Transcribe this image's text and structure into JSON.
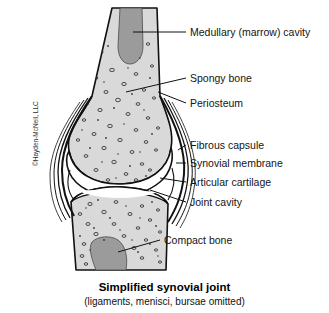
{
  "figure": {
    "title": "Simplified synovial joint",
    "subtitle": "(ligaments, menisci, bursae omitted)",
    "credit": "©Hayden-McNeil, LLC",
    "colors": {
      "background": "#ffffff",
      "bone_fill": "#d9d9d9",
      "marrow_fill": "#9b9b9b",
      "cartilage_fill": "#ffffff",
      "outline": "#111111",
      "text": "#141414"
    }
  },
  "labels": [
    {
      "id": "medullary-cavity",
      "text": "Medullary (marrow) cavity"
    },
    {
      "id": "spongy-bone",
      "text": "Spongy bone"
    },
    {
      "id": "periosteum",
      "text": "Periosteum"
    },
    {
      "id": "fibrous-capsule",
      "text": "Fibrous capsule"
    },
    {
      "id": "synovial-membrane",
      "text": "Synovial membrane"
    },
    {
      "id": "articular-cartilage",
      "text": "Articular cartilage"
    },
    {
      "id": "joint-cavity",
      "text": "Joint cavity"
    },
    {
      "id": "compact-bone",
      "text": "Compact bone"
    }
  ]
}
